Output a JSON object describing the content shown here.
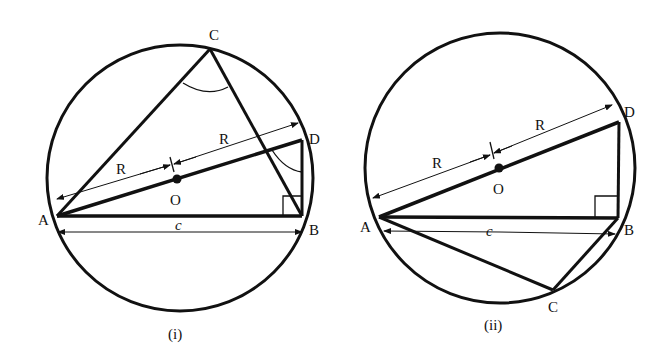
{
  "figures": [
    {
      "caption": "(i)",
      "labels": {
        "A": "A",
        "B": "B",
        "C": "C",
        "D": "D",
        "O": "O",
        "R1": "R",
        "R2": "R",
        "c": "c"
      }
    },
    {
      "caption": "(ii)",
      "labels": {
        "A": "A",
        "B": "B",
        "C": "C",
        "D": "D",
        "O": "O",
        "R1": "R",
        "R2": "R",
        "c": "c"
      }
    }
  ],
  "colors": {
    "stroke": "#111111",
    "background": "#ffffff"
  }
}
